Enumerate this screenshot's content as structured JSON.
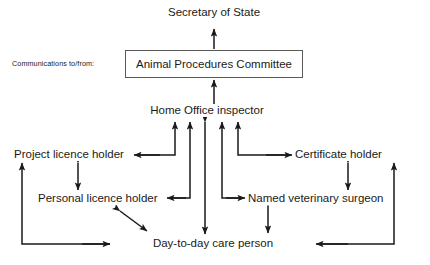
{
  "diagram": {
    "title_text": "Secretary of State",
    "caption": "Communications to/from:",
    "committee": "Animal Procedures Committee",
    "inspector": "Home Office inspector",
    "nodes": {
      "secretary_of_state": "Secretary of State",
      "animal_procedures_committee": "Animal Procedures Committee",
      "home_office_inspector": "Home Office inspector",
      "project_licence_holder": "Project licence holder",
      "certificate_holder": "Certificate holder",
      "personal_licence_holder": "Personal licence holder",
      "named_veterinary_surgeon": "Named veterinary surgeon",
      "day_to_day_care_person": "Day-to-day care person"
    },
    "colors": {
      "background": "#ffffff",
      "line": "#1a1a1a",
      "box_border": "#5a5a5a",
      "text": "#1a1a1a"
    },
    "edges": [
      {
        "from": "animal_procedures_committee",
        "to": "secretary_of_state",
        "direction": "one-way"
      },
      {
        "from": "home_office_inspector",
        "to": "animal_procedures_committee",
        "direction": "one-way"
      },
      {
        "from": "project_licence_holder",
        "to": "home_office_inspector",
        "direction": "one-way"
      },
      {
        "from": "personal_licence_holder",
        "to": "home_office_inspector",
        "direction": "one-way"
      },
      {
        "from": "day_to_day_care_person",
        "to": "home_office_inspector",
        "direction": "two-way"
      },
      {
        "from": "named_veterinary_surgeon",
        "to": "home_office_inspector",
        "direction": "one-way"
      },
      {
        "from": "certificate_holder",
        "to": "home_office_inspector",
        "direction": "one-way"
      },
      {
        "from": "project_licence_holder",
        "to": "personal_licence_holder",
        "direction": "two-way"
      },
      {
        "from": "certificate_holder",
        "to": "named_veterinary_surgeon",
        "direction": "two-way"
      },
      {
        "from": "named_veterinary_surgeon",
        "to": "day_to_day_care_person",
        "direction": "two-way"
      },
      {
        "from": "personal_licence_holder",
        "to": "day_to_day_care_person",
        "direction": "two-way"
      },
      {
        "from": "day_to_day_care_person",
        "to": "project_licence_holder",
        "direction": "one-way"
      },
      {
        "from": "day_to_day_care_person",
        "to": "certificate_holder",
        "direction": "one-way"
      }
    ]
  }
}
